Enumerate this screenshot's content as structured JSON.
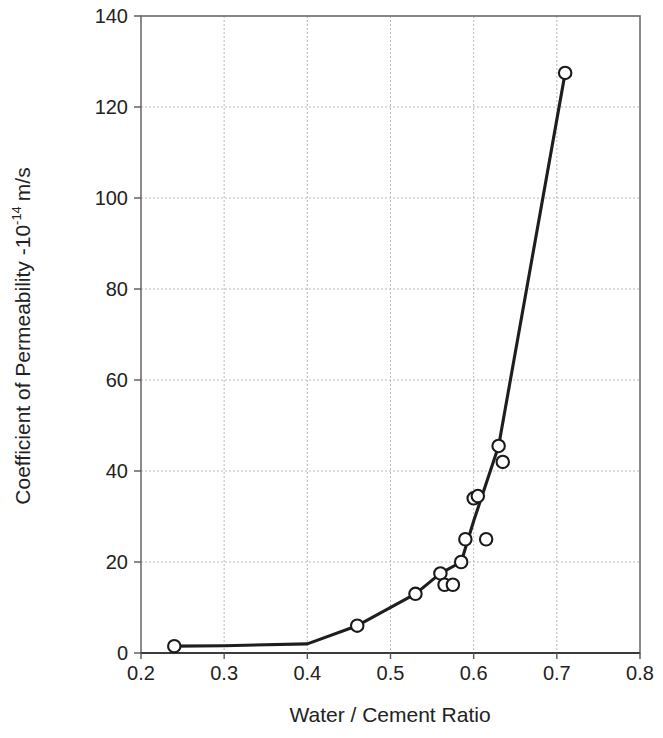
{
  "chart_data": {
    "type": "line",
    "title": "",
    "xlabel": "Water / Cement Ratio",
    "ylabel_text": "Coefficient of Permeability -10",
    "ylabel_exponent": "-14",
    "ylabel_units": "m/s",
    "ylabel_full": "Coefficient of Permeability -10^-14 m/s",
    "xlim": [
      0.2,
      0.8
    ],
    "ylim": [
      0,
      140
    ],
    "xticks": [
      "0.2",
      "0.3",
      "0.4",
      "0.5",
      "0.6",
      "0.7",
      "0.8"
    ],
    "xtick_values": [
      0.2,
      0.3,
      0.4,
      0.5,
      0.6,
      0.7,
      0.8
    ],
    "yticks": [
      "0",
      "20",
      "40",
      "60",
      "80",
      "100",
      "120",
      "140"
    ],
    "ytick_values": [
      0,
      20,
      40,
      60,
      80,
      100,
      120,
      140
    ],
    "grid": true,
    "legend": null,
    "marker_style": "open-circle",
    "line_color": "#1e1e1e",
    "marker_fill": "#ffffff",
    "marker_edge": "#1a1a1a",
    "grid_color": "#b9b9b9",
    "x": [
      0.24,
      0.46,
      0.53,
      0.56,
      0.565,
      0.575,
      0.585,
      0.59,
      0.6,
      0.605,
      0.615,
      0.63,
      0.635,
      0.71
    ],
    "y": [
      1.5,
      6.0,
      13.0,
      17.5,
      15.0,
      15.0,
      20.0,
      25.0,
      34.0,
      34.5,
      25.0,
      45.5,
      42.0,
      127.5
    ],
    "points": [
      {
        "x": 0.24,
        "y": 1.5
      },
      {
        "x": 0.46,
        "y": 6.0
      },
      {
        "x": 0.53,
        "y": 13.0
      },
      {
        "x": 0.56,
        "y": 17.5
      },
      {
        "x": 0.565,
        "y": 15.0
      },
      {
        "x": 0.575,
        "y": 15.0
      },
      {
        "x": 0.585,
        "y": 20.0
      },
      {
        "x": 0.59,
        "y": 25.0
      },
      {
        "x": 0.6,
        "y": 34.0
      },
      {
        "x": 0.605,
        "y": 34.5
      },
      {
        "x": 0.615,
        "y": 25.0
      },
      {
        "x": 0.63,
        "y": 45.5
      },
      {
        "x": 0.635,
        "y": 42.0
      },
      {
        "x": 0.71,
        "y": 127.5
      }
    ],
    "fit_line": [
      {
        "x": 0.24,
        "y": 1.5
      },
      {
        "x": 0.3,
        "y": 1.6
      },
      {
        "x": 0.4,
        "y": 2.0
      },
      {
        "x": 0.46,
        "y": 6.0
      },
      {
        "x": 0.53,
        "y": 13.0
      },
      {
        "x": 0.56,
        "y": 17.5
      },
      {
        "x": 0.585,
        "y": 20.0
      },
      {
        "x": 0.6,
        "y": 29.0
      },
      {
        "x": 0.63,
        "y": 45.5
      },
      {
        "x": 0.71,
        "y": 127.5
      }
    ]
  }
}
